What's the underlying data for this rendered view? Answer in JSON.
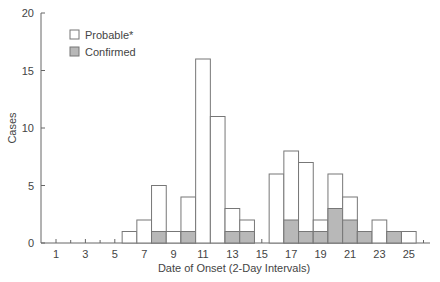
{
  "chart_data": {
    "type": "bar",
    "stacked": true,
    "title": "",
    "xlabel": "Date of Onset (2-Day Intervals)",
    "ylabel": "Cases",
    "ylim": [
      0,
      20
    ],
    "yticks": [
      0,
      5,
      10,
      15,
      20
    ],
    "xticks": [
      1,
      3,
      5,
      7,
      9,
      11,
      13,
      15,
      17,
      19,
      21,
      23,
      25
    ],
    "grid": false,
    "legend_position": "upper-left",
    "x": [
      6,
      7,
      8,
      9,
      10,
      11,
      12,
      13,
      14,
      16,
      17,
      18,
      19,
      20,
      21,
      22,
      23,
      24,
      25
    ],
    "series": [
      {
        "name": "Probable*",
        "color": "#ffffff",
        "values": [
          1,
          2,
          5,
          1,
          4,
          16,
          11,
          3,
          2,
          6,
          8,
          7,
          2,
          6,
          4,
          1,
          2,
          1,
          1
        ],
        "note": "total height"
      },
      {
        "name": "Confirmed",
        "color": "#b8b8b8",
        "values": [
          0,
          0,
          1,
          0,
          1,
          0,
          0,
          1,
          1,
          0,
          2,
          1,
          1,
          3,
          2,
          1,
          0,
          1,
          0
        ]
      }
    ]
  },
  "legend": [
    {
      "label": "Probable*",
      "color": "#ffffff"
    },
    {
      "label": "Confirmed",
      "color": "#b8b8b8"
    }
  ],
  "colors": {
    "axis": "#666666",
    "bar_stroke": "#777777",
    "confirmed": "#b8b8b8",
    "probable": "#ffffff"
  }
}
